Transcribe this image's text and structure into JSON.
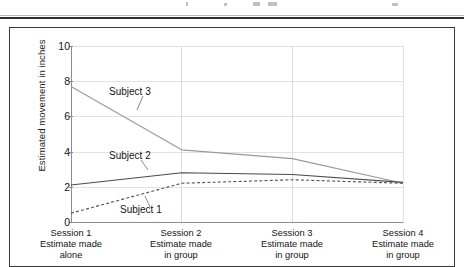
{
  "figure": {
    "caption_rule": "page-separator-rule"
  },
  "chart_data": {
    "type": "line",
    "title": "",
    "xlabel": "",
    "ylabel": "Estimated movement in inches",
    "ylim": [
      0,
      10
    ],
    "yticks": [
      0,
      2,
      4,
      6,
      8,
      10
    ],
    "grid": true,
    "legend_position": "inline-annotations",
    "categories": [
      "Session 1",
      "Session 2",
      "Session 3",
      "Session 4"
    ],
    "category_sublabels": [
      [
        "Session 1",
        "Estimate made",
        "alone"
      ],
      [
        "Session 2",
        "Estimate made",
        "in group"
      ],
      [
        "Session 3",
        "Estimate made",
        "in group"
      ],
      [
        "Session 4",
        "Estimate made",
        "in group"
      ]
    ],
    "series": [
      {
        "name": "Subject 3",
        "values": [
          7.7,
          4.1,
          3.6,
          2.2
        ],
        "style": "solid",
        "color": "#9a9a9a",
        "label_x": 141,
        "label_y": 93
      },
      {
        "name": "Subject 2",
        "values": [
          2.1,
          2.8,
          2.7,
          2.25
        ],
        "style": "solid",
        "color": "#4a4a4a",
        "label_x": 141,
        "label_y": 157
      },
      {
        "name": "Subject 1",
        "values": [
          0.5,
          2.2,
          2.4,
          2.2
        ],
        "style": "dashed",
        "color": "#555555",
        "label_x": 152,
        "label_y": 211
      }
    ]
  },
  "axis": {
    "y_title": "Estimated movement in inches",
    "y_tick_labels": [
      "10",
      "8",
      "6",
      "4",
      "2",
      "0"
    ]
  },
  "x_labels": [
    {
      "session": "Session 1",
      "line2": "Estimate made",
      "line3": "alone"
    },
    {
      "session": "Session 2",
      "line2": "Estimate made",
      "line3": "in group"
    },
    {
      "session": "Session 3",
      "line2": "Estimate made",
      "line3": "in group"
    },
    {
      "session": "Session 4",
      "line2": "Estimate made",
      "line3": "in group"
    }
  ],
  "series_labels": {
    "subject3": "Subject 3",
    "subject2": "Subject 2",
    "subject1": "Subject 1"
  }
}
